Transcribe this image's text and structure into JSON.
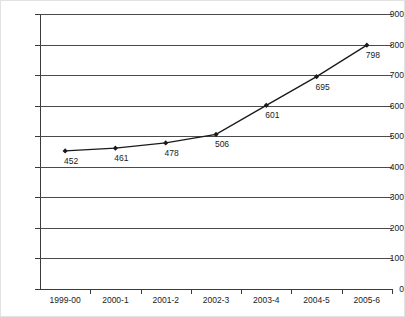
{
  "chart_data": {
    "type": "line",
    "title": "",
    "subtitle": "",
    "xlabel": "",
    "ylabel": "",
    "categories": [
      "1999-00",
      "2000-1",
      "2001-2",
      "2002-3",
      "2003-4",
      "2004-5",
      "2005-6"
    ],
    "values": [
      452,
      461,
      478,
      506,
      601,
      695,
      798
    ],
    "series": [
      {
        "name": "",
        "values": [
          452,
          461,
          478,
          506,
          601,
          695,
          798
        ]
      }
    ],
    "data_labels": [
      "452",
      "461",
      "478",
      "506",
      "601",
      "695",
      "798"
    ],
    "ylim": [
      0,
      900
    ],
    "y_ticks": [
      0,
      100,
      200,
      300,
      400,
      500,
      600,
      700,
      800,
      900
    ],
    "y_tick_labels": [
      "0",
      "100",
      "200",
      "300",
      "400",
      "500",
      "600",
      "700",
      "800",
      "900"
    ],
    "grid": true,
    "legend": false,
    "legend_position": "none",
    "marker": "diamond",
    "line_color": "#1a1a1a",
    "grid_color": "#4a4a4a",
    "axis_color": "#3a3a3a",
    "background_color": "#ffffff"
  }
}
